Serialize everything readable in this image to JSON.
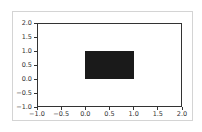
{
  "chart_data": {
    "type": "bar",
    "title": "",
    "xlabel": "",
    "ylabel": "",
    "xlim": [
      -1.0,
      2.0
    ],
    "ylim": [
      -1.0,
      2.0
    ],
    "grid": false,
    "legend": null,
    "shapes": [
      {
        "kind": "rectangle",
        "x": 0.0,
        "y": 0.0,
        "width": 1.0,
        "height": 1.0,
        "color": "#1a1a1a"
      }
    ],
    "xticks": [
      "-1.0",
      "-0.5",
      "0.0",
      "0.5",
      "1.0",
      "1.5",
      "2.0"
    ],
    "yticks": [
      "-1.0",
      "-0.5",
      "0.0",
      "0.5",
      "1.0",
      "1.5",
      "2.0"
    ]
  }
}
